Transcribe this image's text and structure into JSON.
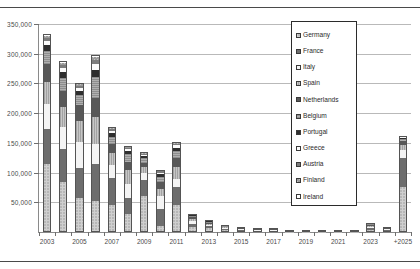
{
  "chart_data": {
    "type": "bar",
    "stacked": true,
    "title": "",
    "subtitle": "",
    "xlabel": "",
    "ylabel": "",
    "grid": true,
    "legend_position": "inside-top-right",
    "ylim": [
      0,
      350000
    ],
    "yticks": [
      50000,
      100000,
      150000,
      200000,
      250000,
      300000,
      350000
    ],
    "ytick_labels": [
      "50,000",
      "100,000",
      "150,000",
      "200,000",
      "250,000",
      "300,000",
      "350,000"
    ],
    "categories": [
      "2003",
      "2004",
      "2005",
      "2006",
      "2007",
      "2008",
      "2009",
      "2010",
      "2011",
      "2012",
      "2013",
      "2014",
      "2015",
      "2016",
      "2017",
      "2018",
      "2019",
      "2020",
      "2021",
      "2022",
      "2023",
      "2024",
      "+2025"
    ],
    "xtick_labels": [
      "2003",
      "2005",
      "2007",
      "2009",
      "2011",
      "2013",
      "2015",
      "2017",
      "2019",
      "2021",
      "2023",
      "+2025"
    ],
    "series": [
      {
        "name": "Germany",
        "swatch": "f-germany",
        "color": "#b7b7b7",
        "values": [
          115000,
          85000,
          58000,
          53000,
          45000,
          30000,
          60000,
          10000,
          46000,
          8000,
          6000,
          3000,
          2000,
          1000,
          1500,
          600,
          400,
          300,
          200,
          200,
          4000,
          2000,
          75000
        ]
      },
      {
        "name": "France",
        "swatch": "f-france",
        "color": "#6d6d6d",
        "values": [
          58000,
          55000,
          50000,
          62000,
          46000,
          28000,
          27000,
          28000,
          30000,
          6000,
          3500,
          2000,
          1500,
          1200,
          1000,
          500,
          400,
          300,
          200,
          200,
          3000,
          1500,
          50000
        ]
      },
      {
        "name": "Italy",
        "swatch": "f-italy",
        "color": "#f4f4f4",
        "values": [
          42000,
          36000,
          43000,
          33000,
          22000,
          22000,
          12000,
          22000,
          13000,
          4000,
          2500,
          1500,
          1200,
          900,
          800,
          400,
          300,
          200,
          150,
          150,
          2000,
          1200,
          13000
        ]
      },
      {
        "name": "Spain",
        "swatch": "f-spain",
        "color": "#a2a2a2",
        "values": [
          38000,
          34000,
          36000,
          46000,
          20000,
          24000,
          10000,
          12000,
          20000,
          3500,
          2200,
          1400,
          1000,
          800,
          700,
          350,
          250,
          200,
          150,
          150,
          1800,
          1000,
          9000
        ]
      },
      {
        "name": "Netherlands",
        "swatch": "f-netherlands",
        "color": "#585858",
        "values": [
          29000,
          28000,
          26000,
          32000,
          15000,
          14000,
          8000,
          12000,
          16000,
          3000,
          1800,
          1100,
          900,
          700,
          600,
          300,
          200,
          150,
          120,
          120,
          1500,
          900,
          6000
        ]
      },
      {
        "name": "Belgium",
        "swatch": "f-belgium",
        "color": "#8e8e8e",
        "values": [
          22000,
          22000,
          17000,
          35000,
          12000,
          13000,
          7000,
          9000,
          12000,
          2500,
          1500,
          900,
          700,
          550,
          500,
          250,
          180,
          130,
          100,
          100,
          1200,
          700,
          4000
        ]
      },
      {
        "name": "Portugal",
        "swatch": "f-portugal",
        "color": "#2e2e2e",
        "values": [
          10000,
          9000,
          8000,
          12000,
          6000,
          5000,
          3500,
          4000,
          5000,
          1200,
          800,
          500,
          400,
          300,
          260,
          130,
          100,
          80,
          60,
          60,
          700,
          400,
          2000
        ]
      },
      {
        "name": "Greece",
        "swatch": "f-greece",
        "color": "#fbfbfb",
        "values": [
          7000,
          7000,
          5000,
          9000,
          4000,
          3500,
          2500,
          3000,
          4000,
          900,
          600,
          400,
          300,
          250,
          200,
          100,
          80,
          60,
          50,
          50,
          500,
          300,
          1200
        ]
      },
      {
        "name": "Austria",
        "swatch": "f-austria",
        "color": "#7c7c7c",
        "values": [
          5000,
          5000,
          3500,
          7000,
          3000,
          2500,
          2000,
          2200,
          2500,
          700,
          450,
          300,
          220,
          180,
          150,
          80,
          60,
          45,
          40,
          40,
          400,
          220,
          900
        ]
      },
      {
        "name": "Finland",
        "swatch": "f-finland",
        "color": "#9a9a9a",
        "values": [
          4000,
          4000,
          2500,
          5000,
          2000,
          2000,
          1500,
          1600,
          1800,
          500,
          350,
          220,
          170,
          140,
          120,
          60,
          45,
          35,
          30,
          30,
          300,
          160,
          600
        ]
      },
      {
        "name": "Ireland",
        "swatch": "f-ireland",
        "color": "#ffffff",
        "values": [
          3000,
          3000,
          2000,
          4000,
          1500,
          1500,
          1000,
          1200,
          1200,
          400,
          250,
          180,
          140,
          110,
          90,
          50,
          35,
          25,
          25,
          25,
          200,
          120,
          400
        ]
      }
    ],
    "totals": [
      333000,
      288000,
      251000,
      298000,
      176500,
      145500,
      134500,
      105000,
      151500,
      30700,
      19950,
      12500,
      9530,
      7130,
      5920,
      2820,
      2050,
      1525,
      1125,
      1125,
      15600,
      8500,
      162100
    ]
  }
}
